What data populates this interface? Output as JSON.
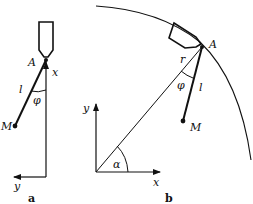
{
  "figure_a": {
    "caption": "a",
    "labels": {
      "A": "A",
      "x": "x",
      "l": "l",
      "phi": "φ",
      "M": "M",
      "y": "y"
    }
  },
  "figure_b": {
    "caption": "b",
    "labels": {
      "A": "A",
      "r": "r",
      "phi": "φ",
      "l": "l",
      "M": "M",
      "y": "y",
      "x": "x",
      "alpha": "α"
    }
  },
  "colors": {
    "stroke": "#111111",
    "background": "#ffffff"
  }
}
